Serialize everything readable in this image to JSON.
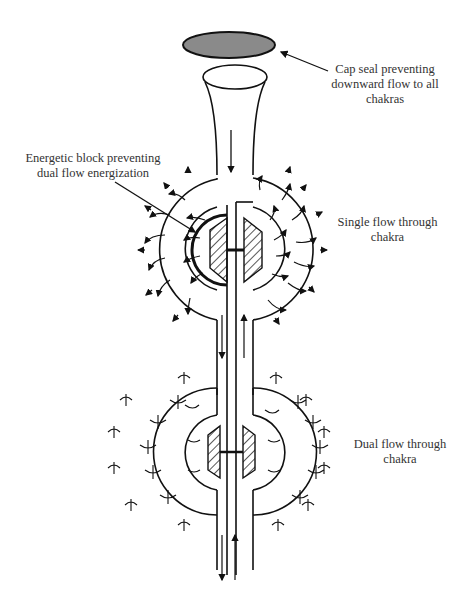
{
  "diagram": {
    "type": "chakra-flow-illustration",
    "labels": {
      "cap_seal": "Cap seal preventing downward flow to all chakras",
      "cap_seal_lines": [
        "Cap seal preventing",
        "downward flow to all",
        "chakras"
      ],
      "energetic_block_lines": [
        "Energetic block preventing",
        "dual flow energization"
      ],
      "single_flow_lines": [
        "Single flow through",
        "chakra"
      ],
      "dual_flow_lines": [
        "Dual flow through",
        "chakra"
      ]
    },
    "components": [
      {
        "name": "cap-seal",
        "shape": "ellipse",
        "fill": "#8a8a8a"
      },
      {
        "name": "funnel-top",
        "shape": "trumpet"
      },
      {
        "name": "upper-chakra",
        "flow": "single"
      },
      {
        "name": "lower-chakra",
        "flow": "dual"
      },
      {
        "name": "central-channel",
        "arrows": [
          "down",
          "up"
        ]
      }
    ],
    "colors": {
      "line": "#111111",
      "cap_fill": "#8a8a8a",
      "background": "#ffffff"
    }
  }
}
